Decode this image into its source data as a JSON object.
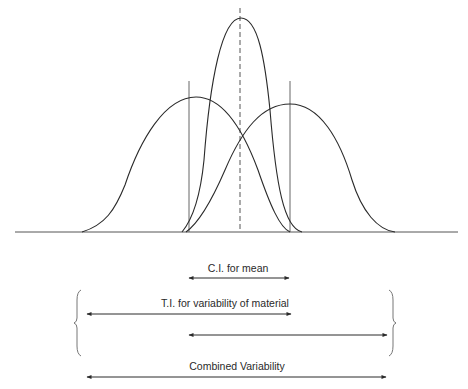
{
  "diagram": {
    "type": "overlapping-normal-distributions",
    "curves": [
      {
        "name": "left-distribution",
        "start_x": 82,
        "peak_x": 196,
        "peak_y": 97,
        "end_x": 290
      },
      {
        "name": "mean-distribution",
        "start_x": 182,
        "peak_x": 241,
        "peak_y": 18,
        "end_x": 302
      },
      {
        "name": "right-distribution",
        "start_x": 186,
        "peak_x": 290,
        "peak_y": 104,
        "end_x": 395
      }
    ],
    "center_line": {
      "style": "dashed",
      "x": 240
    },
    "interval_lines": [
      189,
      290
    ],
    "baseline_y": 232
  },
  "annotations": {
    "ci_mean": {
      "label": "C.I. for mean"
    },
    "ti_material": {
      "label": "T.I. for variability of material"
    },
    "combined": {
      "label": "Combined Variability"
    }
  },
  "colors": {
    "line": "#2a2a2a",
    "guide": "#555555"
  }
}
